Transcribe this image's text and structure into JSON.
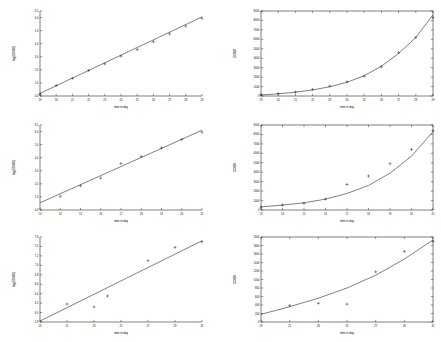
{
  "figure": {
    "background": "#ffffff",
    "line_color": "#000000",
    "rows": 3,
    "cols": 2
  },
  "chart_data": [
    {
      "id": "panel-1-left",
      "type": "scatter",
      "title": "",
      "xlabel": "time in day",
      "ylabel": "log(OD600)",
      "xlim": [
        19,
        29
      ],
      "ylim": [
        0.0,
        6.5
      ],
      "xticks": [
        19,
        20,
        21,
        22,
        23,
        24,
        25,
        26,
        27,
        28,
        29
      ],
      "xticklabels": [
        "19",
        "20",
        "21",
        "22",
        "23",
        "24",
        "25",
        "26",
        "27",
        "28",
        "29"
      ],
      "yticks": [
        0.0,
        1.0,
        2.0,
        3.0,
        4.0,
        5.0,
        6.0,
        6.5
      ],
      "yticklabels": [
        "0.0",
        "1.0",
        "2.0",
        "3.0",
        "4.0",
        "5.0",
        "6.0",
        "6.5"
      ],
      "grid": false,
      "legend": "none",
      "series": [
        {
          "name": "data",
          "marker": "plus",
          "x": [
            19,
            20,
            21,
            22,
            23,
            24,
            25,
            26,
            27,
            28,
            29
          ],
          "y": [
            0.15,
            0.8,
            1.35,
            1.95,
            2.45,
            3.05,
            3.55,
            4.15,
            4.75,
            5.35,
            5.95
          ]
        },
        {
          "name": "fit",
          "type": "line",
          "x": [
            19,
            29
          ],
          "y": [
            0.2,
            6.05
          ]
        }
      ]
    },
    {
      "id": "panel-1-right",
      "type": "scatter",
      "title": "",
      "xlabel": "time in day",
      "ylabel": "OD600",
      "xlim": [
        19,
        29
      ],
      "ylim": [
        0,
        9000
      ],
      "xticks": [
        19,
        20,
        21,
        22,
        23,
        24,
        25,
        26,
        27,
        28,
        29
      ],
      "xticklabels": [
        "19",
        "20",
        "21",
        "22",
        "23",
        "24",
        "25",
        "26",
        "27",
        "28",
        "29"
      ],
      "yticks": [
        0,
        1000,
        2000,
        3000,
        4000,
        5000,
        6000,
        7000,
        8000,
        9000
      ],
      "yticklabels": [
        "0",
        "1000",
        "2000",
        "3000",
        "4000",
        "5000",
        "6000",
        "7000",
        "8000",
        "9000"
      ],
      "grid": false,
      "legend": "none",
      "series": [
        {
          "name": "data",
          "marker": "plus",
          "x": [
            19,
            20,
            21,
            22,
            23,
            24,
            25,
            26,
            27,
            28,
            29
          ],
          "y": [
            120,
            260,
            420,
            700,
            1050,
            1500,
            2100,
            3100,
            4600,
            6200,
            8300
          ]
        },
        {
          "name": "fit",
          "type": "line",
          "x": [
            19,
            20,
            21,
            22,
            23,
            24,
            25,
            26,
            27,
            28,
            29
          ],
          "y": [
            110,
            230,
            400,
            640,
            980,
            1450,
            2150,
            3150,
            4500,
            6200,
            8600
          ]
        }
      ]
    },
    {
      "id": "panel-2-left",
      "type": "scatter",
      "title": "",
      "xlabel": "time in day",
      "ylabel": "log(OD600)",
      "xlim": [
        13,
        21
      ],
      "ylim": [
        0.0,
        6.5
      ],
      "xticks": [
        13,
        14,
        15,
        16,
        17,
        18,
        19,
        20,
        21
      ],
      "xticklabels": [
        "13",
        "14",
        "15",
        "16",
        "17",
        "18",
        "19",
        "20",
        "21"
      ],
      "yticks": [
        0.0,
        1.0,
        2.0,
        3.0,
        4.0,
        5.0,
        6.0,
        6.5
      ],
      "yticklabels": [
        "0.0",
        "1.0",
        "2.0",
        "3.0",
        "4.0",
        "5.0",
        "6.0",
        "6.5"
      ],
      "grid": false,
      "legend": "none",
      "series": [
        {
          "name": "data",
          "marker": "plus",
          "x": [
            14,
            15,
            16,
            17,
            18,
            19,
            20,
            21
          ],
          "y": [
            1.05,
            1.85,
            2.45,
            3.55,
            4.1,
            4.75,
            5.4,
            5.95
          ]
        },
        {
          "name": "fit",
          "type": "line",
          "x": [
            13,
            21
          ],
          "y": [
            0.55,
            6.1
          ]
        }
      ]
    },
    {
      "id": "panel-2-right",
      "type": "scatter",
      "title": "",
      "xlabel": "time in day",
      "ylabel": "OD600",
      "xlim": [
        13,
        21
      ],
      "ylim": [
        0,
        9000
      ],
      "xticks": [
        13,
        14,
        15,
        16,
        17,
        18,
        19,
        20,
        21
      ],
      "xticklabels": [
        "13",
        "14",
        "15",
        "16",
        "17",
        "18",
        "19",
        "20",
        "21"
      ],
      "yticks": [
        0,
        1000,
        2000,
        3000,
        4000,
        5000,
        6000,
        7000,
        8000,
        9000
      ],
      "yticklabels": [
        "0",
        "1000",
        "2000",
        "3000",
        "4000",
        "5000",
        "6000",
        "7000",
        "8000",
        "9000"
      ],
      "grid": false,
      "legend": "none",
      "series": [
        {
          "name": "data",
          "marker": "plus",
          "x": [
            13,
            14,
            15,
            16,
            17,
            18,
            19,
            20,
            21
          ],
          "y": [
            300,
            520,
            700,
            1150,
            2700,
            3600,
            4900,
            6400,
            8400
          ]
        },
        {
          "name": "fit",
          "type": "line",
          "x": [
            13,
            14,
            15,
            16,
            17,
            18,
            19,
            20,
            21
          ],
          "y": [
            330,
            520,
            760,
            1150,
            1750,
            2600,
            3900,
            5700,
            8300
          ]
        }
      ]
    },
    {
      "id": "panel-3-left",
      "type": "scatter",
      "title": "",
      "xlabel": "time in day",
      "ylabel": "log(OD600)",
      "xlim": [
        19,
        31
      ],
      "ylim": [
        5.8,
        7.6
      ],
      "xticks": [
        19,
        21,
        23,
        25,
        27,
        29,
        31
      ],
      "xticklabels": [
        "19",
        "21",
        "23",
        "25",
        "27",
        "29",
        "31"
      ],
      "yticks": [
        5.8,
        6.0,
        6.2,
        6.4,
        6.6,
        6.8,
        7.0,
        7.2,
        7.4,
        7.6
      ],
      "yticklabels": [
        "5.8",
        "6.0",
        "6.2",
        "6.4",
        "6.6",
        "6.8",
        "7.0",
        "7.2",
        "7.4",
        "7.6"
      ],
      "grid": false,
      "legend": "none",
      "series": [
        {
          "name": "data",
          "marker": "plus",
          "x": [
            21,
            23,
            24,
            27,
            29,
            31
          ],
          "y": [
            6.18,
            6.12,
            6.35,
            7.1,
            7.38,
            7.5
          ]
        },
        {
          "name": "fit",
          "type": "line",
          "x": [
            19,
            31
          ],
          "y": [
            5.82,
            7.52
          ]
        }
      ]
    },
    {
      "id": "panel-3-right",
      "type": "scatter",
      "title": "",
      "xlabel": "time in day",
      "ylabel": "OD600",
      "xlim": [
        19,
        31
      ],
      "ylim": [
        0,
        2000
      ],
      "xticks": [
        19,
        21,
        23,
        25,
        27,
        29,
        31
      ],
      "xticklabels": [
        "19",
        "21",
        "23",
        "25",
        "27",
        "29",
        "31"
      ],
      "yticks": [
        0,
        200,
        400,
        600,
        800,
        1000,
        1200,
        1400,
        1600,
        1800,
        2000
      ],
      "yticklabels": [
        "0",
        "200",
        "400",
        "600",
        "800",
        "1000",
        "1200",
        "1400",
        "1600",
        "1800",
        "2000"
      ],
      "grid": false,
      "legend": "none",
      "series": [
        {
          "name": "data",
          "marker": "plus",
          "x": [
            21,
            23,
            25,
            27,
            29,
            31
          ],
          "y": [
            390,
            440,
            420,
            1180,
            1660,
            1900
          ]
        },
        {
          "name": "fit",
          "type": "line",
          "x": [
            19,
            21,
            23,
            25,
            27,
            29,
            31
          ],
          "y": [
            180,
            360,
            560,
            800,
            1100,
            1480,
            1930
          ]
        }
      ]
    }
  ]
}
